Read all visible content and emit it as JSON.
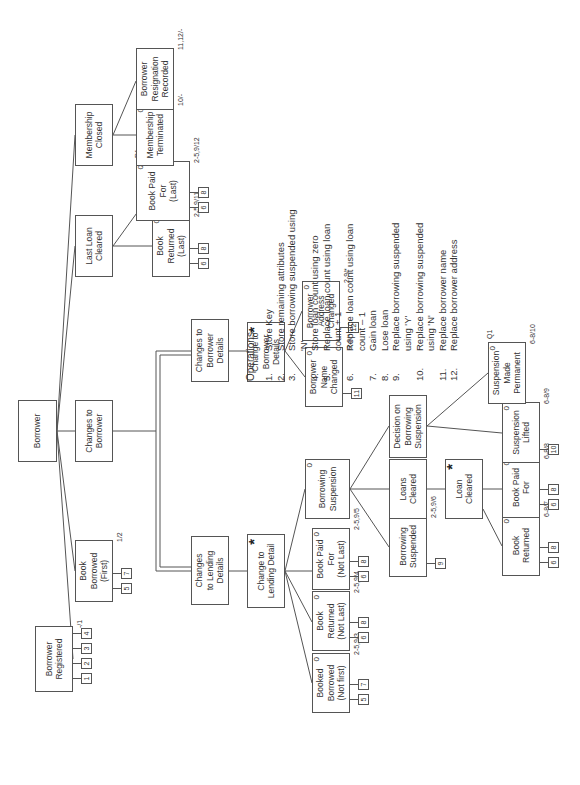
{
  "diagram": {
    "title": "Borrower",
    "orientation": "rotated -90deg",
    "nodes": {
      "borrower": {
        "label": "Borrower"
      },
      "borrower_registered": {
        "label": "Borrower\nRegistered",
        "ops": [
          "1",
          "2",
          "3",
          "4"
        ],
        "annotation": "-/1"
      },
      "book_borrowed_first": {
        "label": "Book\nBorrowed\n(First)",
        "ops": [
          "5",
          "7"
        ],
        "annotation": "1/2"
      },
      "changes_to_borrower": {
        "label": "Changes to\nBorrower"
      },
      "last_loan_cleared": {
        "label": "Last Loan\nCleared"
      },
      "membership_closed": {
        "label": "Membership\nClosed"
      },
      "changes_to_lending_details": {
        "label": "Changes\nto Lending\nDetails"
      },
      "changes_to_borrower_details": {
        "label": "Changes to\nBorrower\nDetails"
      },
      "book_returned_last": {
        "label": "Book\nReturned\n(Last)",
        "corner": "0",
        "ops": [
          "6",
          "8"
        ],
        "annotation": "2-5,9/11"
      },
      "book_paid_for_last": {
        "label": "Book Paid\nFor\n(Last)",
        "corner": "0",
        "ops": [
          "6",
          "8"
        ],
        "annotation": "2-5,9/12",
        "extra": "R1"
      },
      "membership_terminated": {
        "label": "Membership\nTerminated",
        "corner": "0",
        "annotation": "10/-"
      },
      "borrower_resignation_recorded": {
        "label": "Borrower\nResignation\nRecorded",
        "annotation": "11,12/-"
      },
      "change_to_lending_detail": {
        "label": "Change to\nLending Detail",
        "marker": "*"
      },
      "change_to_borrower_details": {
        "label": "Change to\nBorrower\nDetails",
        "marker": "*"
      },
      "booked_borrowed_not_first": {
        "label": "Booked\nBorrowed\n(Not first)",
        "corner": "0",
        "ops": [
          "5",
          "7"
        ],
        "annotation": "2-5,9/3"
      },
      "book_returned_not_last": {
        "label": "Book\nReturned\n(Not Last)",
        "corner": "0",
        "ops": [
          "6",
          "8"
        ],
        "annotation": "2-5,9/4"
      },
      "book_paid_for_not_last": {
        "label": "Book Paid\nFor\n(Not Last)",
        "corner": "0",
        "ops": [
          "6",
          "8"
        ],
        "annotation": "2-5,9/5"
      },
      "borrowing_suspension": {
        "label": "Borrowing\nSuspension",
        "corner": "0"
      },
      "borrower_name_changed": {
        "label": "Borrower\nName\nChanged",
        "corner": "0",
        "ops": [
          "11"
        ],
        "annotation": "2-9/*"
      },
      "borrower_address_changed": {
        "label": "Borrower\nAddress\nChanged",
        "corner": "0",
        "ops": [
          "12"
        ],
        "annotation": "2-9/*"
      },
      "borrowing_suspended": {
        "label": "Borrowing\nSuspended",
        "ops": [
          "9"
        ],
        "annotation": "2-5,9/6"
      },
      "loans_cleared": {
        "label": "Loans\nCleared"
      },
      "decision_on_borrowing_suspension": {
        "label": "Decision on\nBorrowing\nSuspension"
      },
      "loan_cleared": {
        "label": "Loan\nCleared",
        "marker": "*"
      },
      "book_returned": {
        "label": "Book\nReturned",
        "corner": "0",
        "ops": [
          "6",
          "8"
        ],
        "annotation": "6-8/7"
      },
      "book_paid_for": {
        "label": "Book Paid\nFor",
        "corner": "0",
        "ops": [
          "6",
          "8"
        ],
        "annotation": "6-8/8"
      },
      "suspension_lifted": {
        "label": "Suspension\nLifted",
        "corner": "0",
        "ops": [
          "10"
        ],
        "annotation": "6-8/9"
      },
      "suspension_made_permanent": {
        "label": "Suspension\nMade\nPermanent",
        "corner": "0",
        "annotation": "6-8/10",
        "extra": "Q1"
      }
    }
  },
  "legend": {
    "title": "Operations",
    "items": [
      {
        "num": "1.",
        "text": "Store Key"
      },
      {
        "num": "2.",
        "text": "Store remaining attributes"
      },
      {
        "num": "3.",
        "text": "Store borrowing suspended using\n'N'"
      },
      {
        "num": "4.",
        "text": "Store loan count using zero"
      },
      {
        "num": "5.",
        "text": "Replace loan count using loan\ncount + 1"
      },
      {
        "num": "6.",
        "text": "Replace loan count using loan\ncount – 1"
      },
      {
        "num": "7.",
        "text": "Gain loan"
      },
      {
        "num": "8.",
        "text": "Lose loan"
      },
      {
        "num": "9.",
        "text": "Replace borrowing suspended\nusing 'Y'"
      },
      {
        "num": "10.",
        "text": "Replace borrowing suspended\nusing 'N'"
      },
      {
        "num": "11.",
        "text": "Replace borrower name"
      },
      {
        "num": "12.",
        "text": "Replace borrower address"
      }
    ]
  }
}
